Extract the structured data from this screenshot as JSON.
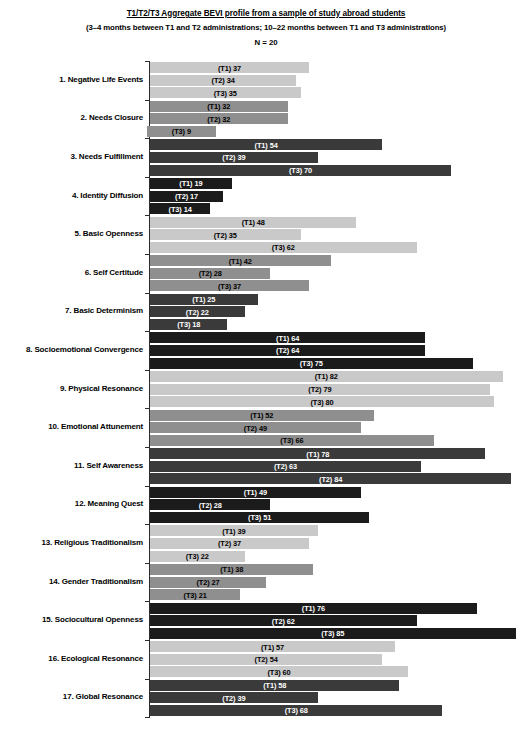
{
  "header": {
    "title": "T1/T2/T3 Aggregate BEVI profile from a sample of study abroad students",
    "subtitle": "(3–4 months between T1 and T2 administrations; 10–22 months between T1 and T3 administrations)",
    "n_label": "N = 20"
  },
  "palette": {
    "light_gray": "#c9c9c9",
    "medium_gray": "#8f8f8f",
    "dark_gray": "#3a3a3a",
    "black": "#1b1b1b"
  },
  "chart_data": {
    "type": "bar",
    "orientation": "horizontal",
    "title": "T1/T2/T3 Aggregate BEVI profile from a sample of study abroad students",
    "subtitle": "(3–4 months between T1 and T2 administrations; 10–22 months between T1 and T3 administrations)",
    "annotation": "N = 20",
    "xlabel": "",
    "ylabel": "",
    "xlim": [
      0,
      90
    ],
    "grid": false,
    "legend": false,
    "categories": [
      "1. Negative Life Events",
      "2. Needs Closure",
      "3. Needs Fulfillment",
      "4. Identity Diffusion",
      "5. Basic Openness",
      "6. Self Certitude",
      "7. Basic Determinism",
      "8. Socioemotional Convergence",
      "9. Physical Resonance",
      "10. Emotional Attunement",
      "11. Self Awareness",
      "12. Meaning Quest",
      "13. Religious Traditionalism",
      "14. Gender Traditionalism",
      "15. Sociocultural Openness",
      "16. Ecological Resonance",
      "17. Global Resonance"
    ],
    "series": [
      {
        "name": "T1",
        "values": [
          37,
          32,
          54,
          19,
          48,
          42,
          25,
          64,
          82,
          52,
          78,
          49,
          39,
          38,
          76,
          57,
          58
        ]
      },
      {
        "name": "T2",
        "values": [
          34,
          32,
          39,
          17,
          35,
          28,
          22,
          64,
          79,
          49,
          63,
          28,
          37,
          27,
          62,
          54,
          39
        ]
      },
      {
        "name": "T3",
        "values": [
          35,
          9,
          70,
          14,
          62,
          37,
          18,
          75,
          80,
          66,
          84,
          51,
          22,
          21,
          85,
          60,
          68
        ]
      }
    ]
  },
  "rows": [
    {
      "label": "1. Negative Life Events",
      "color_key": "light_gray",
      "bars": [
        {
          "label": "(T1) 37",
          "value": 37
        },
        {
          "label": "(T2) 34",
          "value": 34
        },
        {
          "label": "(T3) 35",
          "value": 35
        }
      ]
    },
    {
      "label": "2. Needs Closure",
      "color_key": "medium_gray",
      "bars": [
        {
          "label": "(T1) 32",
          "value": 32
        },
        {
          "label": "(T2) 32",
          "value": 32
        },
        {
          "label": "(T3) 9",
          "value": 9
        }
      ]
    },
    {
      "label": "3. Needs Fulfillment",
      "color_key": "dark_gray",
      "bars": [
        {
          "label": "(T1) 54",
          "value": 54
        },
        {
          "label": "(T2) 39",
          "value": 39
        },
        {
          "label": "(T3) 70",
          "value": 70
        }
      ]
    },
    {
      "label": "4. Identity Diffusion",
      "color_key": "black",
      "bars": [
        {
          "label": "(T1) 19",
          "value": 19
        },
        {
          "label": "(T2) 17",
          "value": 17
        },
        {
          "label": "(T3) 14",
          "value": 14
        }
      ]
    },
    {
      "label": "5. Basic Openness",
      "color_key": "light_gray",
      "bars": [
        {
          "label": "(T1) 48",
          "value": 48
        },
        {
          "label": "(T2) 35",
          "value": 35
        },
        {
          "label": "(T3) 62",
          "value": 62
        }
      ]
    },
    {
      "label": "6. Self Certitude",
      "color_key": "medium_gray",
      "bars": [
        {
          "label": "(T1) 42",
          "value": 42
        },
        {
          "label": "(T2) 28",
          "value": 28
        },
        {
          "label": "(T3) 37",
          "value": 37
        }
      ]
    },
    {
      "label": "7. Basic Determinism",
      "color_key": "dark_gray",
      "bars": [
        {
          "label": "(T1) 25",
          "value": 25
        },
        {
          "label": "(T2) 22",
          "value": 22
        },
        {
          "label": "(T3) 18",
          "value": 18
        }
      ]
    },
    {
      "label": "8. Socioemotional Convergence",
      "color_key": "black",
      "bars": [
        {
          "label": "(T1) 64",
          "value": 64
        },
        {
          "label": "(T2) 64",
          "value": 64
        },
        {
          "label": "(T3) 75",
          "value": 75
        }
      ]
    },
    {
      "label": "9. Physical Resonance",
      "color_key": "light_gray",
      "bars": [
        {
          "label": "(T1) 82",
          "value": 82
        },
        {
          "label": "(T2) 79",
          "value": 79
        },
        {
          "label": "(T3) 80",
          "value": 80
        }
      ]
    },
    {
      "label": "10. Emotional Attunement",
      "color_key": "medium_gray",
      "bars": [
        {
          "label": "(T1) 52",
          "value": 52
        },
        {
          "label": "(T2) 49",
          "value": 49
        },
        {
          "label": "(T3) 66",
          "value": 66
        }
      ]
    },
    {
      "label": "11. Self Awareness",
      "color_key": "dark_gray",
      "bars": [
        {
          "label": "(T1) 78",
          "value": 78
        },
        {
          "label": "(T2) 63",
          "value": 63
        },
        {
          "label": "(T2) 84",
          "value": 84
        }
      ]
    },
    {
      "label": "12. Meaning Quest",
      "color_key": "black",
      "bars": [
        {
          "label": "(T1) 49",
          "value": 49
        },
        {
          "label": "(T2) 28",
          "value": 28
        },
        {
          "label": "(T3) 51",
          "value": 51
        }
      ]
    },
    {
      "label": "13. Religious Traditionalism",
      "color_key": "light_gray",
      "bars": [
        {
          "label": "(T1) 39",
          "value": 39
        },
        {
          "label": "(T2) 37",
          "value": 37
        },
        {
          "label": "(T3) 22",
          "value": 22
        }
      ]
    },
    {
      "label": "14. Gender Traditionalism",
      "color_key": "medium_gray",
      "bars": [
        {
          "label": "(T1) 38",
          "value": 38
        },
        {
          "label": "(T2) 27",
          "value": 27
        },
        {
          "label": "(T3) 21",
          "value": 21
        }
      ]
    },
    {
      "label": "15. Sociocultural Openness",
      "color_key": "black",
      "bars": [
        {
          "label": "(T1) 76",
          "value": 76
        },
        {
          "label": "(T2) 62",
          "value": 62
        },
        {
          "label": "(T3) 85",
          "value": 85
        }
      ]
    },
    {
      "label": "16. Ecological Resonance",
      "color_key": "light_gray",
      "bars": [
        {
          "label": "(T1) 57",
          "value": 57
        },
        {
          "label": "(T2) 54",
          "value": 54
        },
        {
          "label": "(T3) 60",
          "value": 60
        }
      ]
    },
    {
      "label": "17. Global Resonance",
      "color_key": "dark_gray",
      "bars": [
        {
          "label": "(T1) 58",
          "value": 58
        },
        {
          "label": "(T2) 39",
          "value": 39
        },
        {
          "label": "(T3) 68",
          "value": 68
        }
      ]
    }
  ]
}
